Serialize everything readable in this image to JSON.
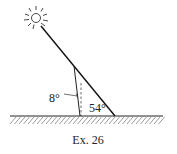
{
  "figure": {
    "caption": "Ex. 26",
    "labels": {
      "pole_angle": "8°",
      "elevation_angle": "54°"
    },
    "angles_deg": {
      "pole_tilt_from_vertical": 8,
      "sun_elevation": 54
    },
    "elements": [
      "sun",
      "sun-ray",
      "tilted-pole",
      "vertical-reference",
      "ground"
    ]
  }
}
